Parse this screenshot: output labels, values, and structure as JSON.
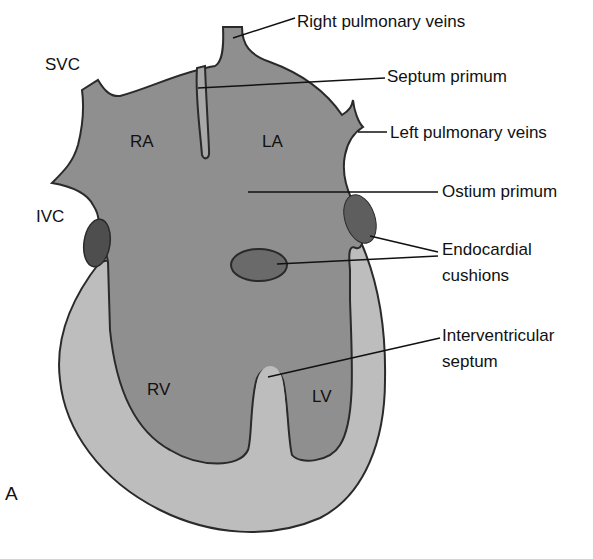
{
  "figure": {
    "panel_label": "A",
    "colors": {
      "background": "#ffffff",
      "chamber_fill": "#8f8f8f",
      "myocardium_fill": "#bdbdbd",
      "cushion_fill": "#6a6a6a",
      "ivc_cushion_fill": "#4e4e4e",
      "outline": "#2a2a2a",
      "leader_line": "#111111"
    },
    "chamber_labels": {
      "ra": "RA",
      "la": "LA",
      "rv": "RV",
      "lv": "LV"
    },
    "vessel_labels": {
      "svc": "SVC",
      "ivc": "IVC"
    },
    "callouts": {
      "right_pulmonary_veins": "Right pulmonary veins",
      "septum_primum": "Septum primum",
      "left_pulmonary_veins": "Left pulmonary veins",
      "ostium_primum": "Ostium primum",
      "endocardial_cushions_line1": "Endocardial",
      "endocardial_cushions_line2": "cushions",
      "interventricular_septum_line1": "Interventricular",
      "interventricular_septum_line2": "septum"
    }
  }
}
